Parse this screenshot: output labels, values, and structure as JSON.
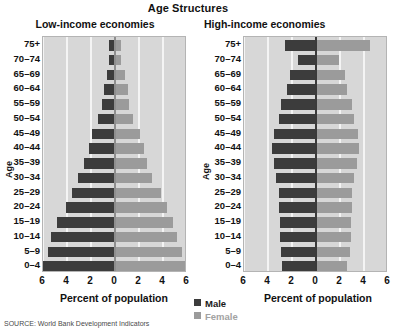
{
  "chart_title": "Age Structures",
  "source_note": "SOURCE: World Bank Development Indicators",
  "legend": {
    "male_label": "Male",
    "female_label": "Female",
    "male_color": "#3c3c3c",
    "female_color": "#9b9b9b"
  },
  "panels": {
    "low": {
      "title": "Low-income economies",
      "xlabel": "Percent of population",
      "ylabel": "Age"
    },
    "high": {
      "title": "High-income economies",
      "xlabel": "Percent of population",
      "ylabel": "Age"
    }
  },
  "chart_data": [
    {
      "type": "bar",
      "title": "Low-income economies",
      "subtitle": "Age Structures",
      "xlabel": "Percent of population",
      "ylabel": "Age",
      "orientation": "horizontal-diverging",
      "grid": true,
      "legend_position": "bottom-center",
      "xlim": [
        -6,
        6
      ],
      "xticks": [
        6,
        4,
        2,
        0,
        2,
        4,
        6
      ],
      "xtick_values": [
        -6,
        -4,
        -2,
        0,
        2,
        4,
        6
      ],
      "categories": [
        "0-4",
        "5-9",
        "10-14",
        "15-19",
        "20-24",
        "25-29",
        "30-34",
        "35-39",
        "40-44",
        "45-49",
        "50-54",
        "55-59",
        "60-64",
        "65-69",
        "70-74",
        "75+"
      ],
      "series": [
        {
          "name": "Male",
          "color": "#3c3c3c",
          "direction": "left",
          "values": [
            6.0,
            5.6,
            5.3,
            4.8,
            4.1,
            3.6,
            3.1,
            2.6,
            2.2,
            1.9,
            1.4,
            1.1,
            0.9,
            0.7,
            0.5,
            0.5
          ]
        },
        {
          "name": "Female",
          "color": "#9b9b9b",
          "direction": "right",
          "values": [
            6.0,
            5.6,
            5.2,
            4.8,
            4.3,
            3.8,
            3.1,
            2.7,
            2.4,
            2.1,
            1.5,
            1.2,
            1.1,
            0.8,
            0.5,
            0.5
          ]
        }
      ]
    },
    {
      "type": "bar",
      "title": "High-income economies",
      "subtitle": "Age Structures",
      "xlabel": "Percent of population",
      "ylabel": "Age",
      "orientation": "horizontal-diverging",
      "grid": true,
      "legend_position": "bottom-center",
      "xlim": [
        -6,
        6
      ],
      "xticks": [
        6,
        4,
        2,
        0,
        2,
        4,
        6
      ],
      "xtick_values": [
        -6,
        -4,
        -2,
        0,
        2,
        4,
        6
      ],
      "note": "Right panel is clipped by the image edge; values beyond about 5.3 percent are cut off.",
      "categories": [
        "0-4",
        "5-9",
        "10-14",
        "15-19",
        "20-24",
        "25-29",
        "30-34",
        "35-39",
        "40-44",
        "45-49",
        "50-54",
        "55-59",
        "60-64",
        "65-69",
        "70-74",
        "75+"
      ],
      "series": [
        {
          "name": "Male",
          "color": "#3c3c3c",
          "direction": "left",
          "values": [
            2.8,
            2.9,
            3.0,
            3.0,
            3.1,
            3.1,
            3.3,
            3.5,
            3.7,
            3.5,
            3.1,
            2.9,
            2.4,
            2.2,
            1.5,
            2.6
          ]
        },
        {
          "name": "Female",
          "color": "#9b9b9b",
          "direction": "right",
          "values": [
            2.6,
            2.8,
            2.9,
            2.9,
            3.0,
            3.0,
            3.2,
            3.4,
            3.6,
            3.5,
            3.2,
            3.0,
            2.6,
            2.4,
            1.9,
            4.5
          ]
        }
      ]
    }
  ]
}
